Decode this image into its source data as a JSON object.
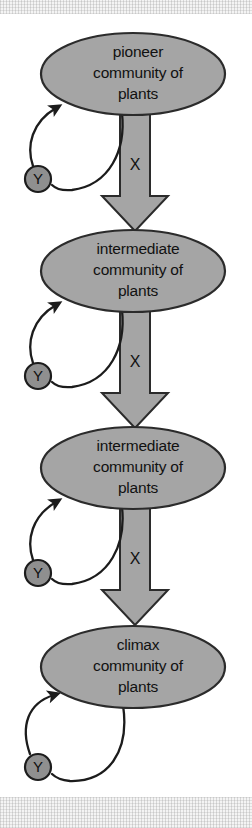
{
  "figure": {
    "type": "succession-cycle-diagram",
    "background_color": "#ffffff",
    "node_fill": "#a5a5a5",
    "node_stroke": "#2b2b2b",
    "arrow_fill": "#a5a5a5",
    "loop_stroke": "#1c1c1c",
    "marker_fill": "#8f8f8f"
  },
  "nodes": [
    {
      "id": "node-1",
      "line1": "pioneer",
      "line2": "community of",
      "line3": "plants",
      "cx": 133,
      "cy": 74,
      "rx": 92,
      "ry": 41
    },
    {
      "id": "node-2",
      "line1": "intermediate",
      "line2": "community of",
      "line3": "plants",
      "cx": 133,
      "cy": 271,
      "rx": 92,
      "ry": 41
    },
    {
      "id": "node-3",
      "line1": "intermediate",
      "line2": "community of",
      "line3": "plants",
      "cx": 133,
      "cy": 468,
      "rx": 92,
      "ry": 41
    },
    {
      "id": "node-4",
      "line1": "climax",
      "line2": "community of",
      "line3": "plants",
      "cx": 133,
      "cy": 667,
      "rx": 92,
      "ry": 41
    }
  ],
  "transition_arrows": [
    {
      "id": "arrow-1",
      "label": "X",
      "label_x": 135,
      "label_y": 166,
      "top": 110,
      "tip": 230
    },
    {
      "id": "arrow-2",
      "label": "X",
      "label_x": 135,
      "label_y": 363,
      "top": 307,
      "tip": 427
    },
    {
      "id": "arrow-3",
      "label": "X",
      "label_x": 135,
      "label_y": 560,
      "top": 504,
      "tip": 624
    }
  ],
  "feedback_loops": [
    {
      "id": "loop-1",
      "marker_label": "Y",
      "marker_cx": 38,
      "marker_cy": 179,
      "marker_r": 13
    },
    {
      "id": "loop-2",
      "marker_label": "Y",
      "marker_cx": 38,
      "marker_cy": 376,
      "marker_r": 13
    },
    {
      "id": "loop-3",
      "marker_label": "Y",
      "marker_cx": 38,
      "marker_cy": 573,
      "marker_r": 13
    },
    {
      "id": "loop-4",
      "marker_label": "Y",
      "marker_cx": 38,
      "marker_cy": 767,
      "marker_r": 13
    }
  ]
}
